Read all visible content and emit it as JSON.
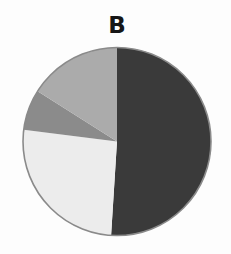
{
  "chart_data": {
    "type": "pie",
    "title": "B",
    "start_angle": "12 o'clock",
    "direction": "clockwise",
    "legend": "none",
    "slices": [
      {
        "label": "Slice 1",
        "value": 51,
        "color": "#3a3a3a"
      },
      {
        "label": "Slice 2",
        "value": 26,
        "color": "#ececec"
      },
      {
        "label": "Slice 3",
        "value": 7,
        "color": "#8b8b8b"
      },
      {
        "label": "Slice 4",
        "value": 16,
        "color": "#ababab"
      }
    ],
    "values": [
      51,
      26,
      7,
      16
    ],
    "categories": [
      "Slice 1",
      "Slice 2",
      "Slice 3",
      "Slice 4"
    ]
  },
  "layout": {
    "center_x": 117,
    "center_y": 141.5,
    "radius": 94,
    "outline_color": "#8a8a8a",
    "background": "#fdfdfd"
  }
}
